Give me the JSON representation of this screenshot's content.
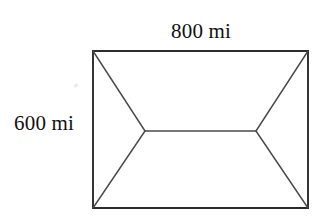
{
  "figure": {
    "name": "rectangle-with-hip-roof-diagonals",
    "type": "geometry-diagram",
    "background_color": "#ffffff",
    "stroke_color": "#3f3f3f",
    "outline_color": "#2b2b2b",
    "text_color": "#111111",
    "canvas": {
      "width": 321,
      "height": 222
    },
    "rectangle": {
      "name": "outer-rectangle",
      "top_left": {
        "x": 93,
        "y": 51
      },
      "top_right": {
        "x": 308,
        "y": 51
      },
      "bottom_right": {
        "x": 308,
        "y": 208
      },
      "bottom_left": {
        "x": 93,
        "y": 208
      },
      "width_px": 215,
      "height_px": 157
    },
    "interior_vertices": [
      {
        "name": "left-ridge-vertex",
        "x": 145,
        "y": 131
      },
      {
        "name": "right-ridge-vertex",
        "x": 256,
        "y": 131
      }
    ],
    "ridge_line": {
      "name": "center-ridge-line",
      "x1": 145,
      "y1": 131,
      "x2": 256,
      "y2": 131
    },
    "diagonals": [
      {
        "name": "diagonal-top-left",
        "x1": 93,
        "y1": 51,
        "x2": 145,
        "y2": 131
      },
      {
        "name": "diagonal-bottom-left",
        "x1": 93,
        "y1": 208,
        "x2": 145,
        "y2": 131
      },
      {
        "name": "diagonal-top-right",
        "x1": 308,
        "y1": 51,
        "x2": 256,
        "y2": 131
      },
      {
        "name": "diagonal-bottom-right",
        "x1": 308,
        "y1": 208,
        "x2": 256,
        "y2": 131
      }
    ],
    "labels": {
      "top": {
        "name": "width-dimension-label",
        "text": "800 mi",
        "value": 800,
        "unit": "mi",
        "position": "above-top-edge"
      },
      "left": {
        "name": "height-dimension-label",
        "text": "600 mi",
        "value": 600,
        "unit": "mi",
        "position": "left-of-left-edge"
      }
    }
  }
}
